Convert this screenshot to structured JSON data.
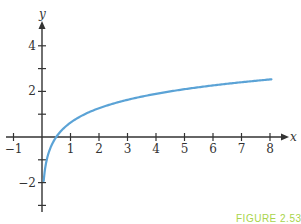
{
  "chart_data": {
    "type": "line",
    "title": "",
    "xlabel": "x",
    "ylabel": "y",
    "xlim": [
      -1.3,
      8.6
    ],
    "ylim": [
      -3.3,
      4.8
    ],
    "x_ticks": [
      -1,
      0,
      1,
      2,
      3,
      4,
      5,
      6,
      7,
      8
    ],
    "x_tick_labels": [
      "-1",
      "",
      "1",
      "2",
      "3",
      "4",
      "5",
      "6",
      "7",
      "8"
    ],
    "y_ticks": [
      -3,
      -2,
      -1,
      1,
      2,
      3,
      4
    ],
    "y_tick_labels": [
      "",
      "-2",
      "",
      "",
      "2",
      "",
      "4"
    ],
    "grid": false,
    "legend": "none",
    "series": [
      {
        "name": "curve",
        "color": "#5ba3d6",
        "function": "approximated as y = log3(2x)",
        "points": [
          {
            "x": 0.06,
            "y": -2.0
          },
          {
            "x": 0.5,
            "y": 0.0
          },
          {
            "x": 1,
            "y": 0.63
          },
          {
            "x": 2,
            "y": 1.26
          },
          {
            "x": 3,
            "y": 1.63
          },
          {
            "x": 4,
            "y": 1.89
          },
          {
            "x": 5,
            "y": 2.1
          },
          {
            "x": 6,
            "y": 2.26
          },
          {
            "x": 7,
            "y": 2.4
          },
          {
            "x": 8,
            "y": 2.52
          }
        ]
      }
    ],
    "annotations": [
      "FIGURE 2.53"
    ]
  },
  "figure_label": "FIGURE 2.53",
  "colors": {
    "axis": "#333333",
    "curve": "#5ba3d6",
    "figure_label": "#a8d44a"
  }
}
